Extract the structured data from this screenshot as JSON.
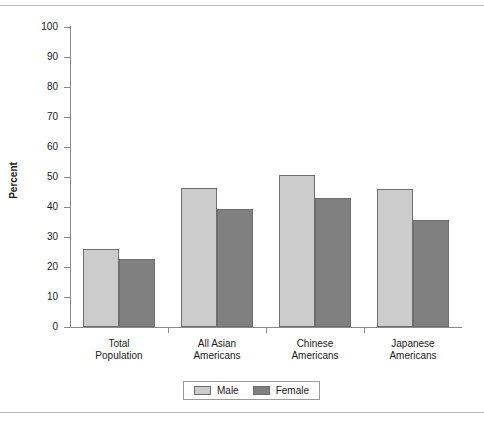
{
  "chart_data": {
    "type": "bar",
    "title": "",
    "xlabel": "",
    "ylabel": "Percent",
    "ylim": [
      0,
      100
    ],
    "ytick_step": 10,
    "yticks": [
      "100",
      "90",
      "80",
      "70",
      "60",
      "50",
      "40",
      "30",
      "20",
      "10",
      "0"
    ],
    "grid": false,
    "legend_position": "bottom-center",
    "categories": [
      "Total Population",
      "All Asian Americans",
      "Chinese Americans",
      "Japanese Americans"
    ],
    "category_lines": [
      [
        "Total",
        "Population"
      ],
      [
        "All Asian",
        "Americans"
      ],
      [
        "Chinese",
        "Americans"
      ],
      [
        "Japanese",
        "Americans"
      ]
    ],
    "series": [
      {
        "name": "Male",
        "color": "#cccccc",
        "values": [
          26.0,
          46.3,
          50.7,
          46.0
        ]
      },
      {
        "name": "Female",
        "color": "#808080",
        "values": [
          22.7,
          39.3,
          43.0,
          35.7
        ]
      }
    ]
  },
  "legend": {
    "entries": [
      {
        "label": "Male",
        "swatch": "male"
      },
      {
        "label": "Female",
        "swatch": "female"
      }
    ]
  }
}
